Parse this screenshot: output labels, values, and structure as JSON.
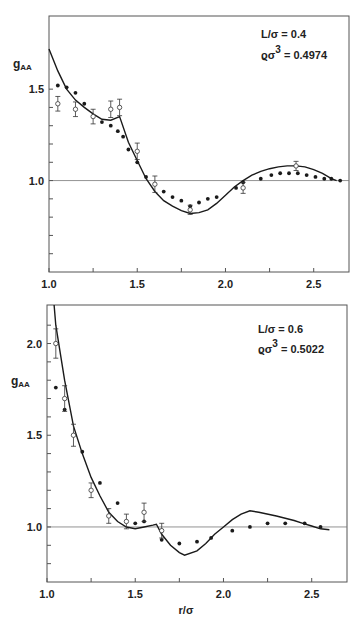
{
  "chart_data": [
    {
      "type": "line",
      "title": "",
      "xlabel": "",
      "ylabel": "g_AA",
      "xlim": [
        1.0,
        2.7
      ],
      "ylim": [
        0.5,
        1.9
      ],
      "x_ticks": [
        1.0,
        1.5,
        2.0,
        2.5
      ],
      "x_tick_labels": [
        "1.0",
        "1.5",
        "2.0",
        "2.5"
      ],
      "x_minor_ticks": [
        1.25,
        1.75,
        2.25
      ],
      "y_ticks": [
        1.0,
        1.5
      ],
      "y_tick_labels": [
        "1.0",
        "1.5"
      ],
      "y_minor_ticks": [
        0.6,
        0.7,
        0.8,
        0.9,
        1.1,
        1.2,
        1.3,
        1.4
      ],
      "reference_line": 1.0,
      "grid": false,
      "annotation": [
        "L/σ = 0.4",
        "ϱσ³ = 0.4974"
      ],
      "series": [
        {
          "name": "theory",
          "style": "solid-line",
          "x": [
            1.0,
            1.05,
            1.1,
            1.15,
            1.2,
            1.25,
            1.3,
            1.35,
            1.4,
            1.45,
            1.5,
            1.55,
            1.6,
            1.65,
            1.7,
            1.75,
            1.8,
            1.85,
            1.9,
            1.95,
            2.0,
            2.05,
            2.1,
            2.15,
            2.2,
            2.25,
            2.3,
            2.35,
            2.4,
            2.45,
            2.5,
            2.55,
            2.6,
            2.63
          ],
          "y": [
            1.72,
            1.6,
            1.5,
            1.44,
            1.4,
            1.365,
            1.335,
            1.33,
            1.35,
            1.21,
            1.11,
            1.01,
            0.94,
            0.89,
            0.86,
            0.835,
            0.82,
            0.825,
            0.84,
            0.875,
            0.92,
            0.965,
            1.0,
            1.03,
            1.05,
            1.065,
            1.075,
            1.08,
            1.08,
            1.075,
            1.06,
            1.04,
            1.01,
            1.0
          ]
        },
        {
          "name": "filled-points",
          "style": "filled-dot",
          "x": [
            1.05,
            1.1,
            1.15,
            1.2,
            1.3,
            1.35,
            1.39,
            1.42,
            1.45,
            1.5,
            1.55,
            1.65,
            1.7,
            1.75,
            1.8,
            1.85,
            1.9,
            1.95,
            2.06,
            2.1,
            2.2,
            2.26,
            2.31,
            2.36,
            2.41,
            2.46,
            2.51,
            2.56,
            2.6,
            2.65
          ],
          "y": [
            1.52,
            1.51,
            1.48,
            1.42,
            1.32,
            1.3,
            1.27,
            1.24,
            1.17,
            1.1,
            1.02,
            0.94,
            0.91,
            0.89,
            0.86,
            0.88,
            0.9,
            0.91,
            0.96,
            0.99,
            1.01,
            1.03,
            1.04,
            1.04,
            1.04,
            1.03,
            1.02,
            1.01,
            1.01,
            1.0
          ]
        },
        {
          "name": "open-points-with-error",
          "style": "open-circle-errorbar",
          "x": [
            1.05,
            1.15,
            1.25,
            1.35,
            1.4,
            1.5,
            1.6,
            1.8,
            2.1,
            2.4
          ],
          "y": [
            1.42,
            1.39,
            1.35,
            1.39,
            1.4,
            1.16,
            0.98,
            0.84,
            0.96,
            1.08
          ],
          "err": [
            0.04,
            0.04,
            0.04,
            0.045,
            0.045,
            0.045,
            0.045,
            0.025,
            0.03,
            0.025
          ]
        }
      ]
    },
    {
      "type": "line",
      "title": "",
      "xlabel": "r/σ",
      "ylabel": "g_AA",
      "xlim": [
        1.0,
        2.7
      ],
      "ylim": [
        0.7,
        2.21
      ],
      "x_ticks": [
        1.0,
        1.5,
        2.0,
        2.5
      ],
      "x_tick_labels": [
        "1.0",
        "1.5",
        "2.0",
        "2.5"
      ],
      "x_minor_ticks": [
        1.25,
        1.75,
        2.25
      ],
      "y_ticks": [
        1.0,
        1.5,
        2.0
      ],
      "y_tick_labels": [
        "1.0",
        "1.5",
        "2.0"
      ],
      "y_minor_ticks": [
        0.8,
        0.9,
        1.1,
        1.2,
        1.3,
        1.4,
        1.6,
        1.7,
        1.8,
        1.9,
        2.1
      ],
      "reference_line": 1.0,
      "grid": false,
      "annotation": [
        "L/σ = 0.6",
        "ϱσ³ = 0.5022"
      ],
      "series": [
        {
          "name": "theory",
          "style": "solid-line",
          "x": [
            1.04,
            1.05,
            1.1,
            1.15,
            1.2,
            1.25,
            1.3,
            1.35,
            1.4,
            1.45,
            1.5,
            1.55,
            1.6,
            1.62,
            1.65,
            1.7,
            1.75,
            1.78,
            1.85,
            1.9,
            1.95,
            2.0,
            2.05,
            2.1,
            2.15,
            2.2,
            2.3,
            2.4,
            2.45,
            2.5,
            2.55,
            2.6
          ],
          "y": [
            2.21,
            2.1,
            1.8,
            1.55,
            1.4,
            1.27,
            1.17,
            1.08,
            1.03,
            1.0,
            0.99,
            1.0,
            1.01,
            1.015,
            0.96,
            0.9,
            0.86,
            0.846,
            0.87,
            0.91,
            0.96,
            1.0,
            1.04,
            1.07,
            1.088,
            1.08,
            1.06,
            1.035,
            1.02,
            1.005,
            0.99,
            0.985
          ]
        },
        {
          "name": "filled-points",
          "style": "filled-dot",
          "x": [
            1.05,
            1.1,
            1.2,
            1.3,
            1.4,
            1.5,
            1.55,
            1.65,
            1.75,
            1.85,
            1.93,
            2.05,
            2.15,
            2.25,
            2.35,
            2.46,
            2.55
          ],
          "y": [
            1.76,
            1.64,
            1.41,
            1.24,
            1.13,
            1.02,
            1.03,
            0.93,
            0.91,
            0.92,
            0.94,
            0.98,
            1.0,
            1.02,
            1.02,
            1.02,
            1.0
          ]
        },
        {
          "name": "open-points-with-error",
          "style": "open-circle-errorbar",
          "x": [
            1.05,
            1.1,
            1.15,
            1.25,
            1.35,
            1.45,
            1.55,
            1.65
          ],
          "y": [
            2.0,
            1.7,
            1.5,
            1.2,
            1.06,
            1.03,
            1.08,
            0.98
          ],
          "err": [
            0.08,
            0.07,
            0.06,
            0.04,
            0.04,
            0.04,
            0.05,
            0.04
          ]
        }
      ]
    }
  ],
  "panels": [
    {
      "ylabel_main": "g",
      "ylabel_sub": "AA",
      "ann_line1": "L/σ  =  0.4",
      "ann_line2_a": "ϱσ",
      "ann_line2_sup": "3",
      "ann_line2_b": " =  0.4974"
    },
    {
      "ylabel_main": "g",
      "ylabel_sub": "AA",
      "ann_line1": "L/σ  =  0.6",
      "ann_line2_a": "ϱσ",
      "ann_line2_sup": "3",
      "ann_line2_b": " =  0.5022",
      "xlabel": "r/σ"
    }
  ],
  "colors": {
    "ink": "#1a1a1a",
    "axis": "#555555",
    "refline": "#777777",
    "background": "#ffffff"
  }
}
